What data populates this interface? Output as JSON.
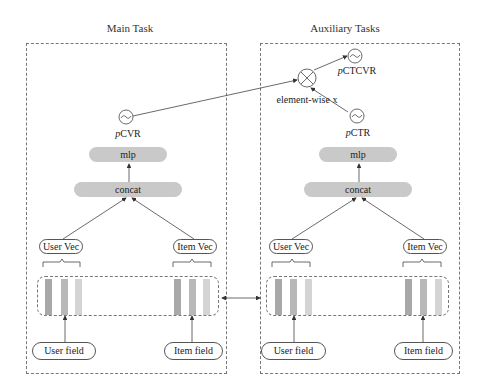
{
  "main_task": {
    "title": "Main Task",
    "output_prefix": "p",
    "output_suffix": "CVR",
    "output_icon": "sigmoid-icon",
    "mlp_label": "mlp",
    "concat_label": "concat",
    "user_vec_label": "User Vec",
    "item_vec_label": "Item Vec",
    "user_field_label": "User field",
    "item_field_label": "Item field"
  },
  "auxiliary_tasks": {
    "title": "Auxiliary Tasks",
    "ctcvr_prefix": "p",
    "ctcvr_suffix": "CTCVR",
    "ctr_prefix": "p",
    "ctr_suffix": "CTR",
    "multiply_label": "element-wise x",
    "multiply_icon": "multiply-icon",
    "output_icon": "sigmoid-icon",
    "mlp_label": "mlp",
    "concat_label": "concat",
    "user_vec_label": "User Vec",
    "item_vec_label": "Item Vec",
    "user_field_label": "User field",
    "item_field_label": "Item field"
  },
  "colors": {
    "block_fill": "#c9c9c9",
    "embedding_dark": "#a8a8a8",
    "embedding_mid": "#b8b8b8",
    "embedding_light": "#d4d4d4",
    "line": "#444444"
  }
}
